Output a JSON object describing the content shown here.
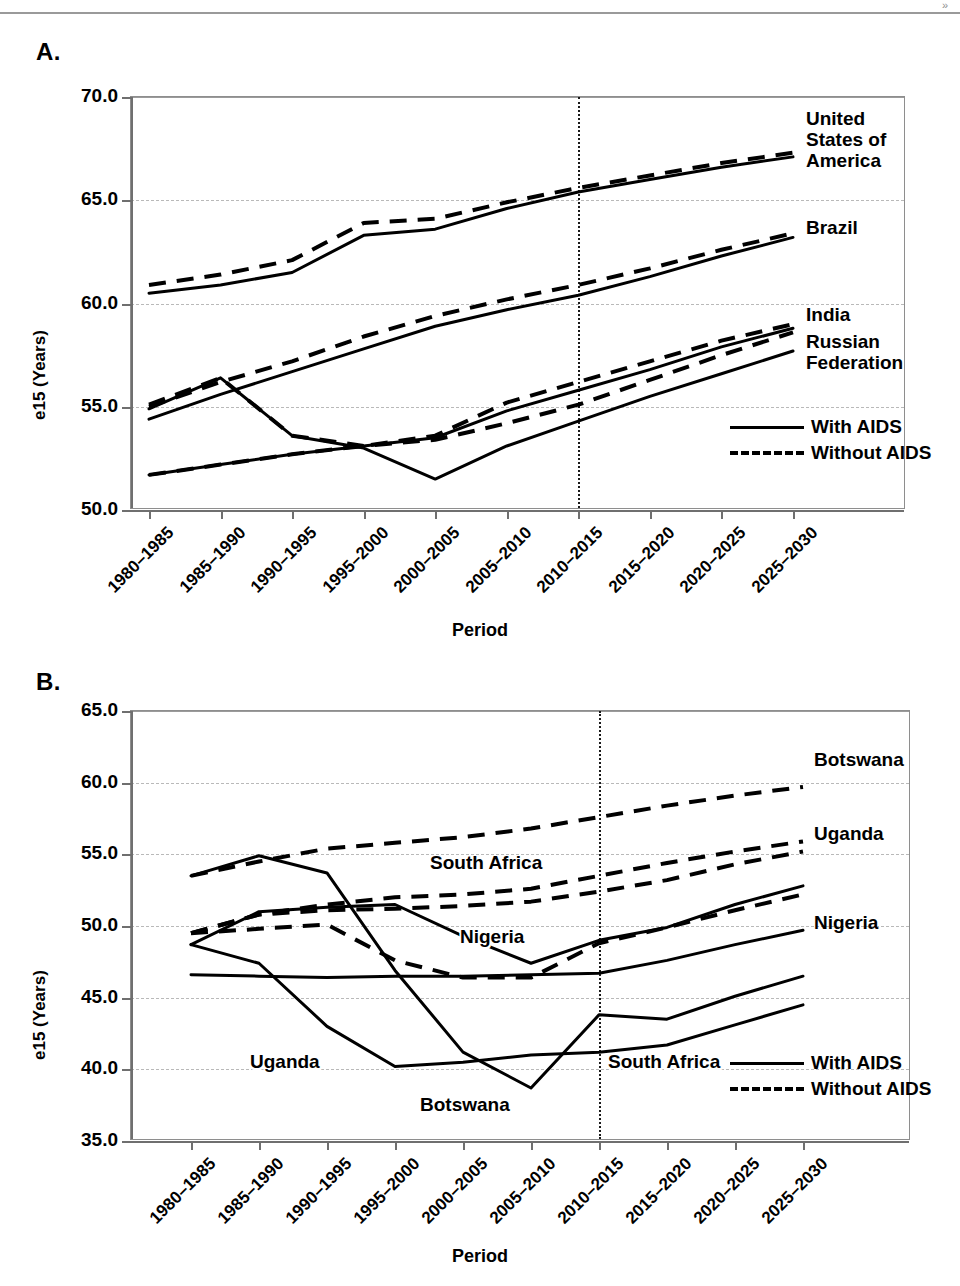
{
  "figure": {
    "top_mark": "»",
    "panels": [
      {
        "letter": "A.",
        "ylabel": "e15 (Years)",
        "xlabel": "Period"
      },
      {
        "letter": "B.",
        "ylabel": "e15 (Years)",
        "xlabel": "Period"
      }
    ],
    "legend": {
      "with_aids": "With AIDS",
      "without_aids": "Without AIDS"
    }
  },
  "chart_data": [
    {
      "type": "line",
      "panel": "A.",
      "title": "",
      "xlabel": "Period",
      "ylabel": "e15 (Years)",
      "ylim": [
        50.0,
        70.0
      ],
      "ytick_labels": [
        "70.0",
        "65.0",
        "60.0",
        "55.0",
        "50.0"
      ],
      "ytick_values": [
        70.0,
        65.0,
        60.0,
        55.0,
        50.0
      ],
      "grid": "horizontal-dashed",
      "legend_position": "inside-lower-right",
      "projection_marker": {
        "label": "",
        "between": [
          "2005–2010",
          "2010–2015"
        ],
        "style": "vertical-dotted"
      },
      "categories": [
        "1980–1985",
        "1985–1990",
        "1990–1995",
        "1995–2000",
        "2000–2005",
        "2005–2010",
        "2010–2015",
        "2015–2020",
        "2020–2025",
        "2025–2030"
      ],
      "series": [
        {
          "name": "United States of America",
          "variant": "With AIDS",
          "style": "solid",
          "values": [
            60.5,
            60.9,
            61.5,
            63.3,
            63.6,
            64.6,
            65.4,
            66.0,
            66.6,
            67.1
          ]
        },
        {
          "name": "United States of America",
          "variant": "Without AIDS",
          "style": "dashed",
          "values": [
            60.9,
            61.4,
            62.1,
            63.9,
            64.1,
            64.9,
            65.6,
            66.2,
            66.8,
            67.3
          ]
        },
        {
          "name": "Brazil",
          "variant": "With AIDS",
          "style": "solid",
          "values": [
            54.4,
            55.6,
            56.7,
            57.8,
            58.9,
            59.7,
            60.4,
            61.3,
            62.3,
            63.2
          ]
        },
        {
          "name": "Brazil",
          "variant": "Without AIDS",
          "style": "dashed",
          "values": [
            55.0,
            56.2,
            57.2,
            58.4,
            59.4,
            60.2,
            60.9,
            61.7,
            62.6,
            63.4
          ]
        },
        {
          "name": "India",
          "variant": "With AIDS",
          "style": "solid",
          "values": [
            51.7,
            52.2,
            52.7,
            53.1,
            53.5,
            54.8,
            55.8,
            56.8,
            57.9,
            58.8
          ]
        },
        {
          "name": "India",
          "variant": "Without AIDS",
          "style": "dashed",
          "values": [
            51.7,
            52.2,
            52.7,
            53.1,
            53.6,
            55.2,
            56.2,
            57.2,
            58.2,
            59.0
          ]
        },
        {
          "name": "Russian Federation",
          "variant": "With AIDS",
          "style": "solid",
          "values": [
            54.9,
            56.4,
            53.6,
            53.0,
            51.5,
            53.1,
            54.3,
            55.5,
            56.6,
            57.7
          ]
        },
        {
          "name": "Russian Federation",
          "variant": "Without AIDS",
          "style": "dashed",
          "values": [
            55.1,
            56.4,
            53.6,
            53.1,
            53.4,
            54.2,
            55.1,
            56.3,
            57.5,
            58.6
          ]
        }
      ],
      "annotations": [
        {
          "text": "United States of America",
          "position": "right-of-plot",
          "anchor_y": 66.9
        },
        {
          "text": "Brazil",
          "position": "right-of-plot",
          "anchor_y": 63.3
        },
        {
          "text": "India",
          "position": "right-of-plot",
          "anchor_y": 58.9
        },
        {
          "text": "Russian Federation",
          "position": "right-of-plot",
          "anchor_y": 57.8
        }
      ]
    },
    {
      "type": "line",
      "panel": "B.",
      "title": "",
      "xlabel": "Period",
      "ylabel": "e15 (Years)",
      "ylim": [
        35.0,
        65.0
      ],
      "ytick_labels": [
        "65.0",
        "60.0",
        "55.0",
        "50.0",
        "45.0",
        "40.0",
        "35.0"
      ],
      "ytick_values": [
        65.0,
        60.0,
        55.0,
        50.0,
        45.0,
        40.0,
        35.0
      ],
      "grid": "horizontal-dashed",
      "legend_position": "inside-lower-right",
      "projection_marker": {
        "label": "",
        "between": [
          "2005–2010",
          "2010–2015"
        ],
        "style": "vertical-dotted"
      },
      "categories": [
        "1980–1985",
        "1985–1990",
        "1990–1995",
        "1995–2000",
        "2000–2005",
        "2005–2010",
        "2010–2015",
        "2015–2020",
        "2020–2025",
        "2025–2030"
      ],
      "series": [
        {
          "name": "Botswana",
          "variant": "With AIDS",
          "style": "solid",
          "values": [
            53.5,
            54.9,
            53.7,
            46.9,
            41.2,
            38.7,
            43.8,
            43.5,
            45.1,
            46.5
          ]
        },
        {
          "name": "Botswana",
          "variant": "Without AIDS",
          "style": "dashed",
          "values": [
            53.5,
            54.5,
            55.4,
            55.8,
            56.2,
            56.8,
            57.6,
            58.4,
            59.1,
            59.7
          ]
        },
        {
          "name": "Uganda",
          "variant": "With AIDS",
          "style": "solid",
          "values": [
            48.7,
            47.4,
            43.0,
            40.2,
            40.5,
            41.0,
            41.2,
            41.7,
            43.1,
            44.5
          ]
        },
        {
          "name": "Uganda",
          "variant": "Without AIDS",
          "style": "dashed",
          "values": [
            49.5,
            50.8,
            51.5,
            52.0,
            52.2,
            52.6,
            53.5,
            54.4,
            55.2,
            55.9
          ]
        },
        {
          "name": "Nigeria",
          "variant": "With AIDS",
          "style": "solid",
          "values": [
            48.7,
            51.0,
            51.3,
            51.5,
            49.3,
            47.4,
            49.0,
            49.9,
            51.5,
            52.8
          ]
        },
        {
          "name": "Nigeria",
          "variant": "Without AIDS",
          "style": "dashed",
          "values": [
            49.5,
            50.8,
            51.1,
            51.2,
            51.4,
            51.7,
            52.4,
            53.2,
            54.3,
            55.2
          ]
        },
        {
          "name": "South Africa",
          "variant": "With AIDS",
          "style": "solid",
          "values": [
            46.6,
            46.5,
            46.4,
            46.5,
            46.5,
            46.6,
            46.7,
            47.6,
            48.7,
            49.7
          ]
        },
        {
          "name": "South Africa",
          "variant": "Without AIDS",
          "style": "dashed",
          "values": [
            49.5,
            49.8,
            50.1,
            47.6,
            46.4,
            46.4,
            48.8,
            49.9,
            51.1,
            52.2
          ]
        }
      ],
      "annotations": [
        {
          "text": "Botswana",
          "position": "right-of-plot",
          "anchor_y": 61.2
        },
        {
          "text": "Uganda",
          "position": "right-of-plot",
          "anchor_y": 56.0
        },
        {
          "text": "Nigeria",
          "position": "right-of-plot",
          "anchor_y": 50.0
        },
        {
          "text": "South Africa",
          "position": "inside",
          "anchor_y": 41.0
        },
        {
          "text": "South Africa",
          "position": "inside-upper",
          "anchor_y": 54.7
        },
        {
          "text": "Nigeria",
          "position": "inside-mid",
          "anchor_y": 49.6
        },
        {
          "text": "Uganda",
          "position": "inside-low",
          "anchor_y": 41.0
        },
        {
          "text": "Botswana",
          "position": "inside-bottom",
          "anchor_y": 37.7
        }
      ]
    }
  ]
}
